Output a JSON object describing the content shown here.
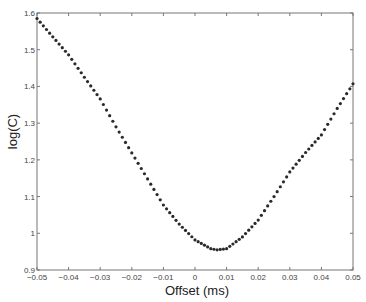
{
  "chart_data": {
    "type": "scatter",
    "title": "",
    "xlabel": "Offset (ms)",
    "ylabel": "log(C)",
    "xlim": [
      -0.05,
      0.05
    ],
    "ylim": [
      0.9,
      1.6
    ],
    "grid": false,
    "legend": null,
    "x_ticks": [
      "-0.05",
      "-0.04",
      "-0.03",
      "-0.02",
      "-0.01",
      "0",
      "0.01",
      "0.02",
      "0.03",
      "0.04",
      "0.05"
    ],
    "y_ticks": [
      "0.9",
      "1",
      "1.1",
      "1.2",
      "1.3",
      "1.4",
      "1.5",
      "1.6"
    ],
    "marker": "dot",
    "marker_color": "#2a2a2a",
    "point_spacing": 0.001,
    "series": [
      {
        "name": "log(C)",
        "x": [
          -0.05,
          -0.045,
          -0.04,
          -0.035,
          -0.03,
          -0.025,
          -0.02,
          -0.015,
          -0.01,
          -0.005,
          0,
          0.005,
          0.007,
          0.01,
          0.015,
          0.02,
          0.025,
          0.03,
          0.035,
          0.04,
          0.045,
          0.05
        ],
        "y": [
          1.585,
          1.535,
          1.486,
          1.425,
          1.366,
          1.29,
          1.219,
          1.148,
          1.077,
          1.025,
          0.982,
          0.958,
          0.955,
          0.958,
          0.99,
          1.036,
          1.1,
          1.167,
          1.22,
          1.268,
          1.34,
          1.407
        ]
      }
    ]
  }
}
